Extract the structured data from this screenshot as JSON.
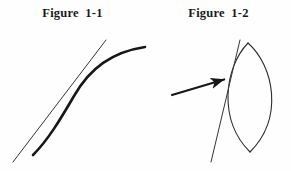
{
  "document": {
    "background_color": "#fefefe",
    "ink_color": "#1a1a1a",
    "figure_count": 2
  },
  "figures": [
    {
      "caption": "Figure  1-1",
      "caption_name": "figure-1-1-caption",
      "description": "A smooth concave curve with a straight tangent line touching it at a single point",
      "elements": {
        "curve_label": "curve",
        "tangent_label": "tangent line"
      },
      "geometry": {
        "curve_path": "M 33 155 C 48 140, 60 120, 74 96 C 90 68, 112 52, 145 47",
        "tangent_path": "M 13 162 L 106 40",
        "tangency_point": [
          68,
          103
        ],
        "curve_stroke_width": 2.6,
        "tangent_stroke_width": 1.0
      }
    },
    {
      "caption": "Figure  1-2",
      "caption_name": "figure-1-2-caption",
      "description": "A lens (vesica) shape with a straight tangent line touching its left arc, and an arrow pointing to the point of tangency",
      "elements": {
        "shape_label": "lens",
        "tangent_label": "tangent line",
        "arrow_label": "pointer arrow"
      },
      "geometry": {
        "lens_left_arc": "M 248 43 C 224 68, 218 120, 250 152",
        "lens_right_arc": "M 248 43 C 274 66, 284 118, 250 152",
        "tangent_path": "M 240 40 L 211 162",
        "arrow_tail": [
          172,
          95
        ],
        "arrow_tip": [
          229,
          78
        ],
        "tangency_point": [
          229,
          79
        ],
        "outline_stroke_width": 1.1,
        "tangent_stroke_width": 1.0,
        "arrow_stroke_width": 2.2
      }
    }
  ]
}
